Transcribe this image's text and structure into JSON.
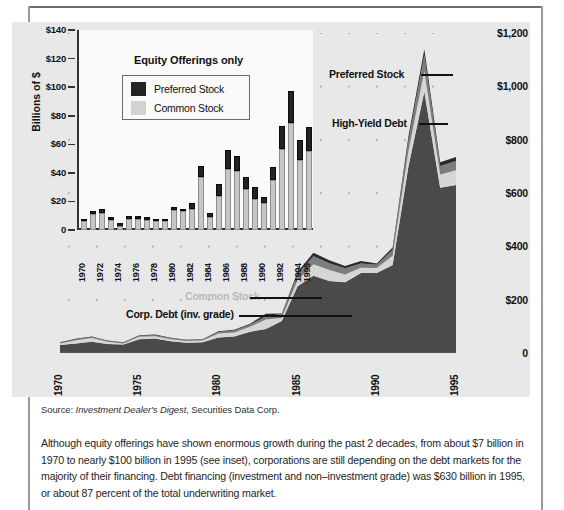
{
  "figure": {
    "panel_bg": "#e8e8e8",
    "colors": {
      "corp_debt": "#4a4a4a",
      "high_yield_debt": "#7d7d7d",
      "common_stock": "#d6d6d6",
      "preferred_stock": "#2b2b2b",
      "preferred_bar": "#232323",
      "common_bar": "#c6c6c6"
    }
  },
  "main_chart_labels": {
    "preferred_stock": "Preferred Stock",
    "high_yield_debt": "High-Yield Debt",
    "common_stock": "Common Stock",
    "corp_debt": "Corp. Debt (inv. grade)"
  },
  "inset_labels": {
    "title": "Equity Offerings only",
    "ylabel": "Billions of $",
    "legend": [
      {
        "label": "Preferred Stock",
        "swatch": "preferred"
      },
      {
        "label": "Common Stock",
        "swatch": "common"
      }
    ]
  },
  "source": {
    "prefix": "Source: ",
    "italic": "Investment Dealer's Digest",
    "suffix": ", Securities Data Corp."
  },
  "caption": {
    "text": "Although equity offerings have shown enormous growth during the past 2 decades, from about $7 billion in 1970 to nearly $100 billion in 1995 (see inset), corporations are still depending on the debt markets for the majority of their financing. Debt financing (investment and non–investment grade) was $630 billion in 1995, or about 87 percent of the total underwriting market."
  },
  "chart_data": [
    {
      "id": "main-area-chart",
      "type": "area",
      "title": "",
      "xlabel": "",
      "ylabel": "",
      "stacked": true,
      "grid": "dotted",
      "legend_position": "inline-callouts",
      "x": [
        1970,
        1971,
        1972,
        1973,
        1974,
        1975,
        1976,
        1977,
        1978,
        1979,
        1980,
        1981,
        1982,
        1983,
        1984,
        1985,
        1986,
        1987,
        1988,
        1989,
        1990,
        1991,
        1992,
        1993,
        1994,
        1995
      ],
      "xticks": [
        "1970",
        "1975",
        "1980",
        "1985",
        "1990",
        "1995"
      ],
      "ylim": [
        0,
        1200
      ],
      "yticks": [
        0,
        200,
        400,
        600,
        800,
        1000,
        1200
      ],
      "ytick_labels": [
        "0",
        "$200",
        "$400",
        "$600",
        "$800",
        "$1,000",
        "$1,200"
      ],
      "series": [
        {
          "name": "Corp. Debt (inv. grade)",
          "color": "#4a4a4a",
          "values": [
            30,
            36,
            42,
            34,
            32,
            52,
            54,
            44,
            38,
            40,
            58,
            62,
            80,
            90,
            120,
            250,
            290,
            270,
            265,
            300,
            300,
            330,
            700,
            980,
            620,
            630
          ]
        },
        {
          "name": "Common Stock",
          "color": "#d6d6d6",
          "values": [
            6,
            12,
            14,
            8,
            4,
            9,
            9,
            8,
            7,
            7,
            15,
            15,
            18,
            36,
            11,
            24,
            43,
            41,
            29,
            20,
            19,
            35,
            58,
            77,
            49,
            55
          ]
        },
        {
          "name": "High-Yield Debt",
          "color": "#7d7d7d",
          "values": [
            2,
            3,
            4,
            3,
            2,
            4,
            4,
            3,
            3,
            3,
            6,
            7,
            9,
            12,
            15,
            22,
            30,
            26,
            24,
            16,
            12,
            22,
            40,
            60,
            32,
            35
          ]
        },
        {
          "name": "Preferred Stock",
          "color": "#2b2b2b",
          "values": [
            2,
            2,
            2,
            2,
            2,
            2,
            2,
            2,
            2,
            2,
            3,
            3,
            3,
            9,
            2,
            8,
            13,
            11,
            8,
            9,
            5,
            9,
            16,
            22,
            14,
            15
          ]
        }
      ]
    },
    {
      "id": "inset-bar-chart",
      "type": "bar",
      "stacked": true,
      "title": "Equity Offerings only",
      "xlabel": "",
      "ylabel": "Billions of $",
      "ylim": [
        0,
        140
      ],
      "yticks": [
        0,
        20,
        40,
        60,
        80,
        100,
        120,
        140
      ],
      "ytick_labels": [
        "0",
        "$20",
        "$40",
        "$60",
        "$80",
        "$100",
        "$120",
        "$140"
      ],
      "categories": [
        1970,
        1971,
        1972,
        1973,
        1974,
        1975,
        1976,
        1977,
        1978,
        1979,
        1980,
        1981,
        1982,
        1983,
        1984,
        1985,
        1986,
        1987,
        1988,
        1989,
        1990,
        1991,
        1992,
        1993,
        1994,
        1995
      ],
      "xtick_labels": [
        "1970",
        "1972",
        "1974",
        "1976",
        "1978",
        "1980",
        "1982",
        "1984",
        "1986",
        "1988",
        "1990",
        "1992",
        "1994",
        "1995"
      ],
      "series": [
        {
          "name": "Common Stock",
          "color": "#c6c6c6",
          "values": [
            6,
            11,
            12,
            7,
            3,
            8,
            8,
            7,
            6,
            6,
            14,
            13,
            15,
            37,
            9,
            24,
            43,
            41,
            29,
            22,
            19,
            35,
            57,
            75,
            49,
            55
          ]
        },
        {
          "name": "Preferred Stock",
          "color": "#232323",
          "values": [
            2,
            2,
            3,
            2,
            2,
            2,
            2,
            2,
            2,
            2,
            2,
            2,
            4,
            8,
            3,
            8,
            13,
            11,
            8,
            8,
            4,
            9,
            16,
            22,
            14,
            17
          ]
        }
      ]
    }
  ]
}
